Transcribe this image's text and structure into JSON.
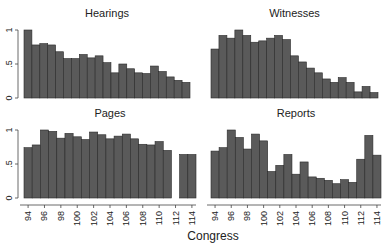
{
  "chart_data": {
    "type": "bar",
    "layout": "2x2 small multiples",
    "xlabel": "Congress",
    "x": [
      94,
      95,
      96,
      97,
      98,
      99,
      100,
      101,
      102,
      103,
      104,
      105,
      106,
      107,
      108,
      109,
      110,
      111,
      112,
      113,
      114
    ],
    "xticks": [
      "94",
      "96",
      "98",
      "100",
      "102",
      "104",
      "106",
      "108",
      "110",
      "112",
      "114"
    ],
    "yticks": [
      "0",
      ".5",
      "1"
    ],
    "ylim": [
      0,
      1
    ],
    "grid": false,
    "bar_color": "#5a5a5a",
    "bar_edge": "#2a2a2a",
    "panels": [
      {
        "title": "Hearings",
        "values": [
          1.0,
          0.78,
          0.8,
          0.78,
          0.68,
          0.58,
          0.58,
          0.64,
          0.59,
          0.62,
          0.52,
          0.37,
          0.5,
          0.43,
          0.37,
          0.36,
          0.47,
          0.39,
          0.31,
          0.26,
          0.23
        ]
      },
      {
        "title": "Witnesses",
        "values": [
          0.72,
          0.92,
          0.88,
          1.0,
          0.92,
          0.82,
          0.84,
          0.88,
          0.92,
          0.86,
          0.62,
          0.53,
          0.44,
          0.37,
          0.28,
          0.23,
          0.3,
          0.23,
          0.09,
          0.17,
          0.08
        ]
      },
      {
        "title": "Pages",
        "values": [
          0.74,
          0.78,
          1.0,
          0.98,
          0.88,
          0.95,
          0.9,
          0.86,
          0.97,
          0.93,
          0.87,
          0.91,
          0.94,
          0.87,
          0.79,
          0.78,
          0.83,
          0.7,
          null,
          0.64,
          0.64
        ]
      },
      {
        "title": "Reports",
        "values": [
          0.69,
          0.74,
          1.0,
          0.89,
          0.72,
          0.94,
          0.84,
          0.39,
          0.48,
          0.64,
          0.35,
          0.53,
          0.31,
          0.29,
          0.26,
          0.21,
          0.27,
          0.23,
          0.57,
          0.92,
          0.63
        ]
      }
    ]
  }
}
